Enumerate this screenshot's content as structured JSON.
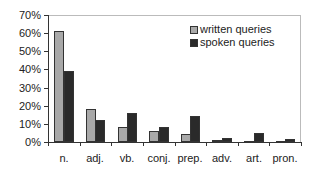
{
  "chart_data": {
    "type": "bar",
    "title": "",
    "xlabel": "",
    "ylabel": "",
    "ylim": [
      0,
      70
    ],
    "yticks": [
      "0%",
      "10%",
      "20%",
      "30%",
      "40%",
      "50%",
      "60%",
      "70%"
    ],
    "categories": [
      "n.",
      "adj.",
      "vb.",
      "conj.",
      "prep.",
      "adv.",
      "art.",
      "pron."
    ],
    "series": [
      {
        "name": "written queries",
        "color": "#a9a9a9",
        "values": [
          61,
          18,
          8,
          6,
          4.5,
          1,
          0.5,
          0.5
        ]
      },
      {
        "name": "spoken queries",
        "color": "#2a2a2a",
        "values": [
          39,
          12,
          16,
          8,
          14.5,
          2,
          5,
          1.5
        ]
      }
    ],
    "grid": false,
    "legend_position": "upper right"
  }
}
